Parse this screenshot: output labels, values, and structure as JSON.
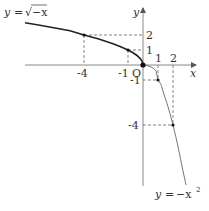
{
  "figure": {
    "type": "function-graph",
    "origin_label": "O",
    "axes": {
      "x_label": "x",
      "y_label": "y",
      "x_ticks": [
        "-4",
        "-1",
        "1",
        "2"
      ],
      "y_ticks": [
        "2",
        "1",
        "-1",
        "-4"
      ]
    },
    "curves": [
      {
        "name": "sqrt-neg-x",
        "label_y": "y",
        "label_eq": "=",
        "label_rhs": "√−x",
        "formula": "y = sqrt(-x)",
        "marked_points": [
          [
            -4,
            2
          ],
          [
            -1,
            1
          ],
          [
            0,
            0
          ]
        ],
        "color": "#222222"
      },
      {
        "name": "neg-x-squared",
        "label_y": "y",
        "label_eq": "=",
        "label_rhs": "−x",
        "label_exp": "2",
        "formula": "y = -x^2",
        "marked_points": [
          [
            0,
            0
          ],
          [
            1,
            -1
          ],
          [
            2,
            -4
          ]
        ],
        "color": "#666666"
      }
    ],
    "colors": {
      "axis": "#777777",
      "dashed": "#555555",
      "curve_bold": "#222222",
      "curve_thin": "#666666"
    }
  }
}
